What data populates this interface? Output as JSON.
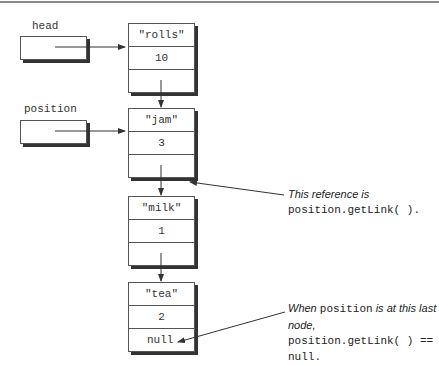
{
  "pointers": {
    "head": {
      "label": "head"
    },
    "position": {
      "label": "position"
    }
  },
  "nodes": [
    {
      "data": "\"rolls\"",
      "count": "10",
      "link": ""
    },
    {
      "data": "\"jam\"",
      "count": "3",
      "link": ""
    },
    {
      "data": "\"milk\"",
      "count": "1",
      "link": ""
    },
    {
      "data": "\"tea\"",
      "count": "2",
      "link": "null"
    }
  ],
  "notes": {
    "reference": {
      "italic": "This reference is",
      "code": "position.getLink( )."
    },
    "last_node": {
      "italic1": "When ",
      "code1": "position",
      "italic2": " is at this last node,",
      "code2": "position.getLink( ) == null."
    }
  }
}
